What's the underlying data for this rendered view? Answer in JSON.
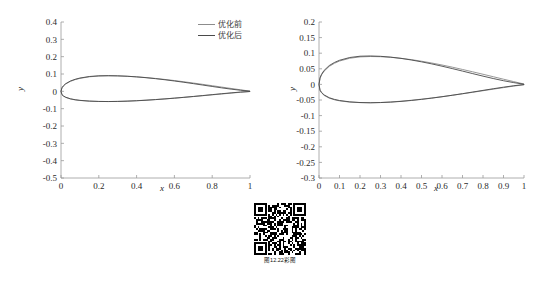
{
  "figure": {
    "caption": "图12.22彩图",
    "qr_alt": "qr-code"
  },
  "colors": {
    "before": "#8c8c8c",
    "after": "#4a4a4a",
    "axis": "#9a9a9a",
    "text": "#2b2b2b"
  },
  "legend": {
    "before_label": "优化前",
    "after_label": "优化后"
  },
  "chart_data": [
    {
      "type": "line",
      "id": "left-airfoil-plot",
      "title": "",
      "xlabel": "x",
      "ylabel": "y",
      "xlim": [
        0,
        1
      ],
      "ylim": [
        -0.5,
        0.4
      ],
      "xticks": [
        "0",
        "0.2",
        "0.4",
        "0.6",
        "0.8",
        "1"
      ],
      "xtick_values": [
        0,
        0.2,
        0.4,
        0.6,
        0.8,
        1
      ],
      "yticks": [
        "0.4",
        "0.3",
        "0.2",
        "0.1",
        "0",
        "-0.1",
        "-0.2",
        "-0.3",
        "-0.4",
        "-0.5"
      ],
      "ytick_values": [
        0.4,
        0.3,
        0.2,
        0.1,
        0,
        -0.1,
        -0.2,
        -0.3,
        -0.4,
        -0.5
      ],
      "grid": false,
      "legend_position": "top-right",
      "series": [
        {
          "name": "优化前",
          "color": "#8c8c8c",
          "upper_x": [
            0,
            0.005,
            0.0125,
            0.025,
            0.05,
            0.075,
            0.1,
            0.15,
            0.2,
            0.25,
            0.3,
            0.35,
            0.4,
            0.45,
            0.5,
            0.55,
            0.6,
            0.65,
            0.7,
            0.75,
            0.8,
            0.85,
            0.9,
            0.95,
            1
          ],
          "upper_y": [
            0,
            0.0195,
            0.0305,
            0.0425,
            0.0577,
            0.0676,
            0.0748,
            0.0838,
            0.0881,
            0.0894,
            0.0888,
            0.0868,
            0.0836,
            0.0794,
            0.0744,
            0.0686,
            0.0622,
            0.0553,
            0.0479,
            0.0403,
            0.0325,
            0.0246,
            0.0167,
            0.0089,
            0.0012
          ],
          "lower_x": [
            0,
            0.005,
            0.0125,
            0.025,
            0.05,
            0.075,
            0.1,
            0.15,
            0.2,
            0.25,
            0.3,
            0.35,
            0.4,
            0.45,
            0.5,
            0.55,
            0.6,
            0.65,
            0.7,
            0.75,
            0.8,
            0.85,
            0.9,
            0.95,
            1
          ],
          "lower_y": [
            0,
            -0.0195,
            -0.0272,
            -0.0352,
            -0.0441,
            -0.0493,
            -0.0527,
            -0.0567,
            -0.0584,
            -0.0588,
            -0.058,
            -0.0563,
            -0.0538,
            -0.0508,
            -0.0473,
            -0.0435,
            -0.0393,
            -0.0348,
            -0.0302,
            -0.0253,
            -0.0203,
            -0.0153,
            -0.0103,
            -0.0054,
            -0.0012
          ]
        },
        {
          "name": "优化后",
          "color": "#4a4a4a",
          "upper_x": [
            0,
            0.005,
            0.0125,
            0.025,
            0.05,
            0.075,
            0.1,
            0.15,
            0.2,
            0.25,
            0.3,
            0.35,
            0.4,
            0.45,
            0.5,
            0.55,
            0.6,
            0.65,
            0.7,
            0.75,
            0.8,
            0.85,
            0.9,
            0.95,
            1
          ],
          "upper_y": [
            0,
            0.0205,
            0.0318,
            0.0442,
            0.0596,
            0.0695,
            0.0766,
            0.0855,
            0.0896,
            0.0905,
            0.0895,
            0.0871,
            0.0834,
            0.0787,
            0.0731,
            0.0668,
            0.0598,
            0.0523,
            0.0444,
            0.0362,
            0.0281,
            0.0201,
            0.0127,
            0.0062,
            0.0008
          ],
          "lower_x": [
            0,
            0.005,
            0.0125,
            0.025,
            0.05,
            0.075,
            0.1,
            0.15,
            0.2,
            0.25,
            0.3,
            0.35,
            0.4,
            0.45,
            0.5,
            0.55,
            0.6,
            0.65,
            0.7,
            0.75,
            0.8,
            0.85,
            0.9,
            0.95,
            1
          ],
          "lower_y": [
            0,
            -0.0188,
            -0.0262,
            -0.0341,
            -0.0431,
            -0.0484,
            -0.052,
            -0.0563,
            -0.0583,
            -0.0589,
            -0.0583,
            -0.0568,
            -0.0544,
            -0.0514,
            -0.0478,
            -0.0438,
            -0.0394,
            -0.0346,
            -0.0296,
            -0.0244,
            -0.0191,
            -0.0138,
            -0.0088,
            -0.0042,
            -0.0008
          ]
        }
      ]
    },
    {
      "type": "line",
      "id": "right-airfoil-plot",
      "title": "",
      "xlabel": "x",
      "ylabel": "y",
      "xlim": [
        0,
        1
      ],
      "ylim": [
        -0.3,
        0.2
      ],
      "xticks": [
        "0",
        "0.1",
        "0.2",
        "0.3",
        "0.4",
        "0.5",
        "0.6",
        "0.7",
        "0.8",
        "0.9",
        "1"
      ],
      "xtick_values": [
        0,
        0.1,
        0.2,
        0.3,
        0.4,
        0.5,
        0.6,
        0.7,
        0.8,
        0.9,
        1
      ],
      "yticks": [
        "0.2",
        "0.15",
        "0.1",
        "0.05",
        "0",
        "-0.05",
        "-0.1",
        "-0.15",
        "-0.2",
        "-0.25",
        "-0.3"
      ],
      "ytick_values": [
        0.2,
        0.15,
        0.1,
        0.05,
        0,
        -0.05,
        -0.1,
        -0.15,
        -0.2,
        -0.25,
        -0.3
      ],
      "grid": false,
      "legend_position": "top-right",
      "series": [
        {
          "name": "优化前",
          "color": "#8c8c8c",
          "upper_x": [
            0,
            0.005,
            0.0125,
            0.025,
            0.05,
            0.075,
            0.1,
            0.15,
            0.2,
            0.25,
            0.3,
            0.35,
            0.4,
            0.45,
            0.5,
            0.55,
            0.6,
            0.65,
            0.7,
            0.75,
            0.8,
            0.85,
            0.9,
            0.95,
            1
          ],
          "upper_y": [
            0,
            0.0195,
            0.0305,
            0.0425,
            0.0577,
            0.0676,
            0.0748,
            0.0838,
            0.0881,
            0.0894,
            0.0888,
            0.0868,
            0.0836,
            0.0794,
            0.0744,
            0.0686,
            0.0622,
            0.0553,
            0.0479,
            0.0403,
            0.0325,
            0.0246,
            0.0167,
            0.0089,
            0.0012
          ],
          "lower_x": [
            0,
            0.005,
            0.0125,
            0.025,
            0.05,
            0.075,
            0.1,
            0.15,
            0.2,
            0.25,
            0.3,
            0.35,
            0.4,
            0.45,
            0.5,
            0.55,
            0.6,
            0.65,
            0.7,
            0.75,
            0.8,
            0.85,
            0.9,
            0.95,
            1
          ],
          "lower_y": [
            0,
            -0.0195,
            -0.0272,
            -0.0352,
            -0.0441,
            -0.0493,
            -0.0527,
            -0.0567,
            -0.0584,
            -0.0588,
            -0.058,
            -0.0563,
            -0.0538,
            -0.0508,
            -0.0473,
            -0.0435,
            -0.0393,
            -0.0348,
            -0.0302,
            -0.0253,
            -0.0203,
            -0.0153,
            -0.0103,
            -0.0054,
            -0.0012
          ]
        },
        {
          "name": "优化后",
          "color": "#4a4a4a",
          "upper_x": [
            0,
            0.005,
            0.0125,
            0.025,
            0.05,
            0.075,
            0.1,
            0.15,
            0.2,
            0.25,
            0.3,
            0.35,
            0.4,
            0.45,
            0.5,
            0.55,
            0.6,
            0.65,
            0.7,
            0.75,
            0.8,
            0.85,
            0.9,
            0.95,
            1
          ],
          "upper_y": [
            0,
            0.021,
            0.0325,
            0.045,
            0.0604,
            0.0702,
            0.0773,
            0.0862,
            0.0903,
            0.0911,
            0.09,
            0.0874,
            0.0834,
            0.0783,
            0.0723,
            0.0657,
            0.0584,
            0.0507,
            0.0427,
            0.0345,
            0.0265,
            0.0188,
            0.0118,
            0.0057,
            0.0005
          ],
          "lower_x": [
            0,
            0.005,
            0.0125,
            0.025,
            0.05,
            0.075,
            0.1,
            0.15,
            0.2,
            0.25,
            0.3,
            0.35,
            0.4,
            0.45,
            0.5,
            0.55,
            0.6,
            0.65,
            0.7,
            0.75,
            0.8,
            0.85,
            0.9,
            0.95,
            1
          ],
          "lower_y": [
            0,
            -0.0185,
            -0.0258,
            -0.0337,
            -0.0427,
            -0.048,
            -0.0516,
            -0.056,
            -0.0581,
            -0.0588,
            -0.0582,
            -0.0568,
            -0.0545,
            -0.0515,
            -0.048,
            -0.044,
            -0.0396,
            -0.0348,
            -0.0297,
            -0.0245,
            -0.0192,
            -0.0139,
            -0.0089,
            -0.0043,
            -0.0005
          ]
        }
      ]
    }
  ]
}
